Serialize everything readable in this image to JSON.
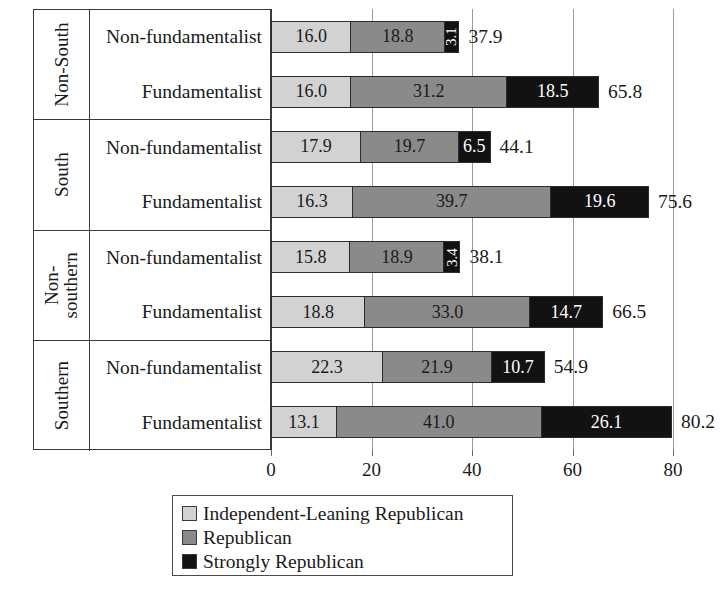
{
  "chart_data": {
    "type": "bar",
    "orientation": "horizontal",
    "stacked": true,
    "title": "",
    "xlabel": "",
    "ylabel": "",
    "xlim": [
      0,
      80
    ],
    "xticks": [
      0,
      20,
      40,
      60,
      80
    ],
    "xtick_labels": [
      "0",
      "20",
      "40",
      "60",
      "80"
    ],
    "grid": true,
    "legend_position": "bottom",
    "series": [
      {
        "name": "Independent-Leaning Republican",
        "color": "#d2d2d2",
        "values": [
          16.0,
          16.0,
          17.9,
          16.3,
          15.8,
          18.8,
          22.3,
          13.1
        ]
      },
      {
        "name": "Republican",
        "color": "#8a8a8a",
        "values": [
          18.8,
          31.2,
          19.7,
          39.7,
          18.9,
          33.0,
          21.9,
          41.0
        ]
      },
      {
        "name": "Strongly Republican",
        "color": "#121212",
        "values": [
          3.1,
          18.5,
          6.5,
          19.6,
          3.4,
          14.7,
          10.7,
          26.1
        ]
      }
    ],
    "categories": [
      "Non-South / Non-fundamentalist",
      "Non-South / Fundamentalist",
      "South / Non-fundamentalist",
      "South / Fundamentalist",
      "Non-southern / Non-fundamentalist",
      "Non-southern / Fundamentalist",
      "Southern / Non-fundamentalist",
      "Southern / Fundamentalist"
    ],
    "totals": [
      37.9,
      65.8,
      44.1,
      75.6,
      38.1,
      66.5,
      54.9,
      80.2
    ]
  },
  "groups": [
    {
      "name": "Non-South",
      "two_line": false,
      "rows": [
        {
          "label": "Non-fundamentalist",
          "segments": [
            {
              "value": 16.0,
              "text": "16.0",
              "series": 0
            },
            {
              "value": 18.8,
              "text": "18.8",
              "series": 1
            },
            {
              "value": 3.1,
              "text": "3.1",
              "series": 2
            }
          ],
          "total": "37.9"
        },
        {
          "label": "Fundamentalist",
          "segments": [
            {
              "value": 16.0,
              "text": "16.0",
              "series": 0
            },
            {
              "value": 31.2,
              "text": "31.2",
              "series": 1
            },
            {
              "value": 18.5,
              "text": "18.5",
              "series": 2
            }
          ],
          "total": "65.8"
        }
      ]
    },
    {
      "name": "South",
      "two_line": false,
      "rows": [
        {
          "label": "Non-fundamentalist",
          "segments": [
            {
              "value": 17.9,
              "text": "17.9",
              "series": 0
            },
            {
              "value": 19.7,
              "text": "19.7",
              "series": 1
            },
            {
              "value": 6.5,
              "text": "6.5",
              "series": 2
            }
          ],
          "total": "44.1"
        },
        {
          "label": "Fundamentalist",
          "segments": [
            {
              "value": 16.3,
              "text": "16.3",
              "series": 0
            },
            {
              "value": 39.7,
              "text": "39.7",
              "series": 1
            },
            {
              "value": 19.6,
              "text": "19.6",
              "series": 2
            }
          ],
          "total": "75.6"
        }
      ]
    },
    {
      "name": "Non-southern",
      "two_line": true,
      "rows": [
        {
          "label": "Non-fundamentalist",
          "segments": [
            {
              "value": 15.8,
              "text": "15.8",
              "series": 0
            },
            {
              "value": 18.9,
              "text": "18.9",
              "series": 1
            },
            {
              "value": 3.4,
              "text": "3.4",
              "series": 2
            }
          ],
          "total": "38.1"
        },
        {
          "label": "Fundamentalist",
          "segments": [
            {
              "value": 18.8,
              "text": "18.8",
              "series": 0
            },
            {
              "value": 33.0,
              "text": "33.0",
              "series": 1
            },
            {
              "value": 14.7,
              "text": "14.7",
              "series": 2
            }
          ],
          "total": "66.5"
        }
      ]
    },
    {
      "name": "Southern",
      "two_line": false,
      "rows": [
        {
          "label": "Non-fundamentalist",
          "segments": [
            {
              "value": 22.3,
              "text": "22.3",
              "series": 0
            },
            {
              "value": 21.9,
              "text": "21.9",
              "series": 1
            },
            {
              "value": 10.7,
              "text": "10.7",
              "series": 2
            }
          ],
          "total": "54.9"
        },
        {
          "label": "Fundamentalist",
          "segments": [
            {
              "value": 13.1,
              "text": "13.1",
              "series": 0
            },
            {
              "value": 41.0,
              "text": "41.0",
              "series": 1
            },
            {
              "value": 26.1,
              "text": "26.1",
              "series": 2
            }
          ],
          "total": "80.2"
        }
      ]
    }
  ],
  "axis": {
    "ticks": [
      "0",
      "20",
      "40",
      "60",
      "80"
    ],
    "tick_values": [
      0,
      20,
      40,
      60,
      80
    ]
  },
  "legend": {
    "items": [
      {
        "label": "Independent-Leaning Republican",
        "color": "#d2d2d2"
      },
      {
        "label": "Republican",
        "color": "#8a8a8a"
      },
      {
        "label": "Strongly Republican",
        "color": "#121212"
      }
    ]
  }
}
